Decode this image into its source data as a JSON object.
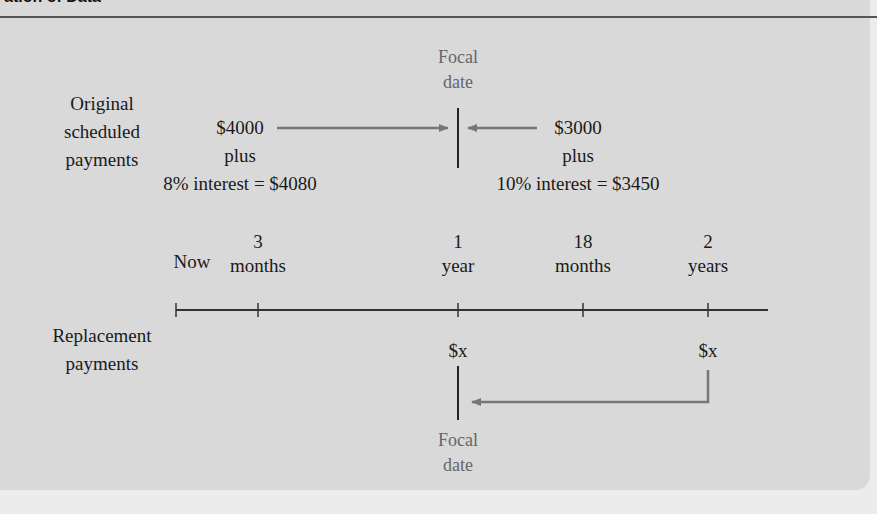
{
  "header": {
    "title": "ation of Data"
  },
  "colors": {
    "panel": "#d9d9d9",
    "arrow": "#777777",
    "line": "#222222",
    "focal_text": "#666666"
  },
  "diagram": {
    "focal_date_top": {
      "line1": "Focal",
      "line2": "date"
    },
    "focal_date_bottom": {
      "line1": "Focal",
      "line2": "date"
    },
    "original_label": {
      "line1": "Original",
      "line2": "scheduled",
      "line3": "payments"
    },
    "replacement_label": {
      "line1": "Replacement",
      "line2": "payments"
    },
    "payment_left": {
      "amount": "$4000",
      "plus": "plus",
      "interest": "8% interest = $4080"
    },
    "payment_right": {
      "amount": "$3000",
      "plus": "plus",
      "interest": "10% interest = $3450"
    },
    "timeline": [
      {
        "top": "",
        "bottom": "Now"
      },
      {
        "top": "3",
        "bottom": "months"
      },
      {
        "top": "1",
        "bottom": "year"
      },
      {
        "top": "18",
        "bottom": "months"
      },
      {
        "top": "2",
        "bottom": "years"
      }
    ],
    "replacement_payments": [
      {
        "label": "$x",
        "at": "1 year"
      },
      {
        "label": "$x",
        "at": "2 years"
      }
    ]
  }
}
